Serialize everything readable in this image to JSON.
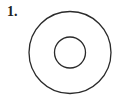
{
  "problem": {
    "number_label": "1."
  },
  "figure": {
    "type": "concentric-circles",
    "stroke_color": "#2a2a2a",
    "outer_circle": {
      "cx": 70,
      "cy": 52.5,
      "r": 41
    },
    "inner_circle": {
      "cx": 70,
      "cy": 52.5,
      "r": 15.5
    }
  }
}
